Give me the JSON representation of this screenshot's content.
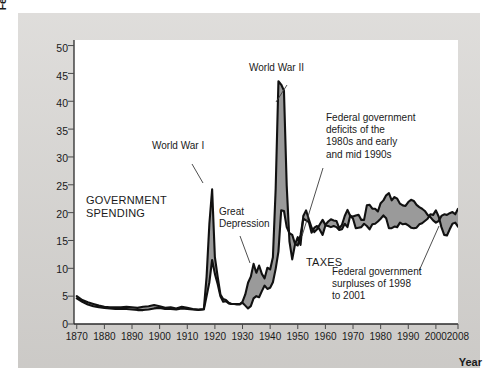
{
  "axes": {
    "ylabel_line1": "Federal government spending and tax collections",
    "ylabel_line2": "(percent of total output)",
    "xlabel": "Year",
    "yticks": [
      "0",
      "5",
      "10",
      "15",
      "20",
      "25",
      "30",
      "35",
      "40",
      "45",
      "50"
    ],
    "xticks": [
      "1870",
      "1880",
      "1890",
      "1900",
      "1910",
      "1920",
      "1930",
      "1940",
      "1950",
      "1960",
      "1970",
      "1980",
      "1990",
      "2000",
      "2008"
    ]
  },
  "annotations": {
    "ww1": "World War I",
    "ww2": "World War II",
    "great_depression": "Great\nDepression",
    "government_spending": "GOVERNMENT\nSPENDING",
    "taxes": "TAXES",
    "deficits": "Federal government\ndeficits of the\n1980s and early\nand mid 1990s",
    "surpluses": "Federal government\nsurpluses of 1998\nto 2001"
  },
  "colors": {
    "panel": "#d4d2cf",
    "plot_background": "#ffffff",
    "spending_line": "#111111",
    "taxes_line": "#111111",
    "gap_fill": "#9a9a9a",
    "axis": "#2b2b2b",
    "text": "#1a1a1a"
  },
  "chart_data": {
    "type": "area",
    "title": "",
    "xlabel": "Year",
    "ylabel": "Federal government spending and tax collections (percent of total output)",
    "xlim": [
      1869,
      2008
    ],
    "ylim": [
      0,
      51
    ],
    "grid": false,
    "legend": "inline-labels",
    "yticks": [
      0,
      5,
      10,
      15,
      20,
      25,
      30,
      35,
      40,
      45,
      50
    ],
    "xticks": [
      1870,
      1880,
      1890,
      1900,
      1910,
      1920,
      1930,
      1940,
      1950,
      1960,
      1970,
      1980,
      1990,
      2000,
      2008
    ],
    "x": [
      1870,
      1872,
      1874,
      1876,
      1878,
      1880,
      1882,
      1884,
      1886,
      1888,
      1890,
      1892,
      1894,
      1896,
      1898,
      1900,
      1902,
      1904,
      1906,
      1908,
      1910,
      1912,
      1914,
      1916,
      1917,
      1918,
      1919,
      1920,
      1921,
      1922,
      1923,
      1924,
      1925,
      1926,
      1927,
      1928,
      1929,
      1930,
      1931,
      1932,
      1933,
      1934,
      1935,
      1936,
      1937,
      1938,
      1939,
      1940,
      1941,
      1942,
      1943,
      1944,
      1945,
      1946,
      1947,
      1948,
      1949,
      1950,
      1951,
      1952,
      1953,
      1954,
      1955,
      1956,
      1957,
      1958,
      1959,
      1960,
      1961,
      1962,
      1963,
      1964,
      1965,
      1966,
      1967,
      1968,
      1969,
      1970,
      1971,
      1972,
      1973,
      1974,
      1975,
      1976,
      1977,
      1978,
      1979,
      1980,
      1981,
      1982,
      1983,
      1984,
      1985,
      1986,
      1987,
      1988,
      1989,
      1990,
      1991,
      1992,
      1993,
      1994,
      1995,
      1996,
      1997,
      1998,
      1999,
      2000,
      2001,
      2002,
      2003,
      2004,
      2005,
      2006,
      2007,
      2008
    ],
    "series": [
      {
        "name": "GOVERNMENT SPENDING",
        "values": [
          5.0,
          4.3,
          3.9,
          3.6,
          3.3,
          3.1,
          3.0,
          3.0,
          3.0,
          3.1,
          3.0,
          2.9,
          3.1,
          3.2,
          3.4,
          3.2,
          2.9,
          3.0,
          2.8,
          3.1,
          2.9,
          2.7,
          2.6,
          2.7,
          8.5,
          18.0,
          24.2,
          12.0,
          8.5,
          5.3,
          4.5,
          4.3,
          3.8,
          3.6,
          3.6,
          3.5,
          3.5,
          4.0,
          5.3,
          7.4,
          8.5,
          10.8,
          9.2,
          10.5,
          9.0,
          8.2,
          10.1,
          9.8,
          12.0,
          24.3,
          43.6,
          43.0,
          41.9,
          24.8,
          14.8,
          11.6,
          14.3,
          15.6,
          14.2,
          19.4,
          20.4,
          18.8,
          17.3,
          16.5,
          17.0,
          17.9,
          18.7,
          17.8,
          18.4,
          18.8,
          18.6,
          18.5,
          17.2,
          17.8,
          19.4,
          20.5,
          19.4,
          19.3,
          19.5,
          19.6,
          18.7,
          18.7,
          21.3,
          21.4,
          20.7,
          20.7,
          20.2,
          21.7,
          22.2,
          23.1,
          23.5,
          22.2,
          22.8,
          22.5,
          21.6,
          21.3,
          21.2,
          21.9,
          22.3,
          22.1,
          21.4,
          21.0,
          20.7,
          20.3,
          19.6,
          19.2,
          18.6,
          18.2,
          18.5,
          19.4,
          19.7,
          19.6,
          19.9,
          20.1,
          19.7,
          20.7
        ],
        "color": "#111111",
        "style": "upper-envelope"
      },
      {
        "name": "TAXES",
        "values": [
          4.6,
          4.0,
          3.5,
          3.2,
          3.0,
          2.9,
          2.8,
          2.7,
          2.7,
          2.7,
          2.6,
          2.5,
          2.5,
          2.6,
          2.8,
          2.9,
          2.7,
          2.7,
          2.6,
          2.8,
          2.7,
          2.6,
          2.5,
          2.6,
          5.0,
          7.5,
          11.5,
          9.0,
          7.2,
          5.0,
          4.0,
          4.1,
          3.7,
          3.6,
          3.6,
          3.6,
          3.6,
          3.8,
          3.3,
          2.8,
          3.2,
          4.6,
          5.0,
          4.8,
          5.9,
          6.9,
          6.3,
          6.5,
          7.5,
          9.9,
          13.0,
          20.4,
          20.3,
          17.4,
          16.3,
          16.0,
          14.4,
          14.1,
          16.0,
          18.9,
          18.6,
          18.3,
          16.4,
          17.3,
          17.6,
          16.9,
          16.0,
          17.7,
          17.6,
          17.4,
          17.6,
          17.4,
          16.9,
          17.0,
          18.0,
          17.4,
          19.5,
          18.9,
          17.2,
          17.3,
          17.4,
          18.0,
          17.6,
          17.0,
          17.9,
          18.0,
          18.4,
          18.9,
          19.5,
          19.0,
          17.2,
          17.2,
          17.5,
          17.4,
          18.2,
          17.9,
          18.0,
          17.7,
          17.3,
          17.2,
          17.3,
          17.9,
          18.1,
          18.5,
          18.9,
          19.7,
          19.6,
          20.4,
          19.3,
          17.4,
          16.0,
          15.9,
          17.0,
          18.0,
          18.2,
          17.5
        ],
        "color": "#111111",
        "style": "lower-envelope"
      }
    ],
    "fill_between": {
      "label": "deficit (spending above taxes) / surplus",
      "color": "#9a9a9a",
      "between": [
        "GOVERNMENT SPENDING",
        "TAXES"
      ]
    },
    "annotations": [
      {
        "text": "World War I",
        "x": 1918,
        "y": 24.2
      },
      {
        "text": "World War II",
        "x": 1944,
        "y": 43.6
      },
      {
        "text": "Great Depression",
        "x": 1933,
        "y": 8.5
      },
      {
        "text": "GOVERNMENT SPENDING",
        "x": 1890,
        "y": 17.0
      },
      {
        "text": "TAXES",
        "x": 1948,
        "y": 10.0
      },
      {
        "text": "Federal government deficits of the 1980s and early and mid 1990s",
        "x": 1986,
        "y": 22.0
      },
      {
        "text": "Federal government surpluses of 1998 to 2001",
        "x": 1999,
        "y": 19.5
      }
    ]
  }
}
